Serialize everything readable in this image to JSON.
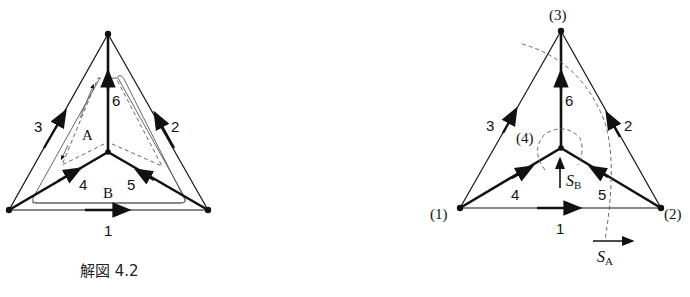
{
  "caption": "解図 4.2",
  "colors": {
    "ink": "#111111",
    "dashed": "#666666",
    "loop": "#555555"
  },
  "left_diagram": {
    "edge_labels": {
      "e1": "1",
      "e2": "2",
      "e3": "3",
      "e4": "4",
      "e5": "5",
      "e6": "6"
    },
    "loop_labels": {
      "A": "A",
      "B": "B"
    }
  },
  "right_diagram": {
    "node_labels": {
      "n1": "(1)",
      "n2": "(2)",
      "n3": "(3)",
      "n4": "(4)"
    },
    "edge_labels": {
      "e1": "1",
      "e2": "2",
      "e3": "3",
      "e4": "4",
      "e5": "5",
      "e6": "6"
    },
    "cutsets": {
      "SA": {
        "main": "S",
        "sub": "A"
      },
      "SB": {
        "main": "S",
        "sub": "B"
      }
    }
  }
}
